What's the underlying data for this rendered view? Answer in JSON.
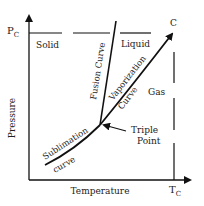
{
  "diagram": {
    "type": "phase-diagram",
    "axes": {
      "y_label": "Pressure",
      "x_label": "Temperature",
      "y_marker": "P",
      "y_marker_sub": "C",
      "x_marker": "T",
      "x_marker_sub": "C"
    },
    "regions": {
      "solid": "Solid",
      "liquid": "Liquid",
      "gas": "Gas"
    },
    "curves": {
      "fusion": "Fusion Curve",
      "vaporization_line1": "Vaporization",
      "vaporization_line2": "Curve",
      "sublimation_line1": "Sublimation",
      "sublimation_line2": "curve"
    },
    "points": {
      "critical": "C",
      "triple_line1": "Triple",
      "triple_line2": "Point"
    },
    "colors": {
      "line": "#111111",
      "text": "#222222",
      "background": "#ffffff"
    }
  }
}
